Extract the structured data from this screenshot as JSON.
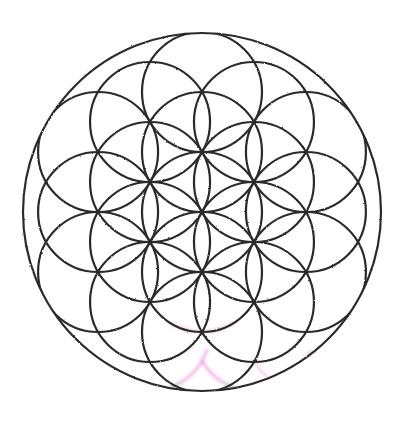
{
  "artwork": {
    "title": "Flower of Life",
    "subject": "sacred-geometry-mandala",
    "description": "Hand-drawn / scanned black line drawing of the Flower of Life: overlapping equal circles arranged on a triangular lattice, clipped by a single large bounding circle.",
    "background_color": "#ffffff",
    "line_color": "#2c2b2b",
    "line_width": 2.2,
    "canvas": {
      "width": 405,
      "height": 432
    }
  },
  "geometry": {
    "outer_circle": {
      "name": "bounding-circle",
      "cx": 202,
      "cy": 212,
      "r": 179,
      "stroke_width": 2.2
    },
    "unit_circle_radius": 60,
    "lattice": {
      "type": "triangular",
      "spacing": 60,
      "column_step_x": 51.96,
      "row_step_y": 60,
      "origin_x": 202,
      "origin_y": 212,
      "rings": 3
    },
    "petal_rings": 3,
    "inner_circle_count": 37,
    "clip_radius": 179
  },
  "artifacts": {
    "label": "jpeg-chroma-fringe",
    "magenta": "#e36fd2",
    "green": "#7fd67f",
    "notes": "Faint colour fringing along the lower arcs of the drawing.",
    "fringes": [
      {
        "cx": 150,
        "cy": 331,
        "r": 60,
        "a0": 18,
        "a1": 70,
        "color": "#e36fd2"
      },
      {
        "cx": 150,
        "cy": 331,
        "r": 60,
        "a0": 60,
        "a1": 86,
        "color": "#8ada8a"
      },
      {
        "cx": 254,
        "cy": 331,
        "r": 60,
        "a0": 96,
        "a1": 150,
        "color": "#e36fd2"
      },
      {
        "cx": 254,
        "cy": 331,
        "r": 60,
        "a0": 20,
        "a1": 70,
        "color": "#e36fd2"
      },
      {
        "cx": 254,
        "cy": 331,
        "r": 60,
        "a0": 92,
        "a1": 118,
        "color": "#8ada8a"
      },
      {
        "cx": 202,
        "cy": 272,
        "r": 60,
        "a0": 58,
        "a1": 122,
        "color": "#dd8fd0"
      },
      {
        "cx": 306,
        "cy": 331,
        "r": 60,
        "a0": 108,
        "a1": 152,
        "color": "#e0a3d8"
      }
    ]
  },
  "palette": {
    "ink": "#2c2b2b",
    "paper": "#ffffff",
    "fringe_magenta": "#e36fd2",
    "fringe_green": "#7fd67f"
  }
}
